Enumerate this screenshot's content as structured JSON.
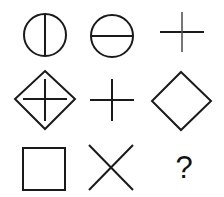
{
  "puzzle": {
    "type": "3x3 figure matrix",
    "rows": 3,
    "cols": 3,
    "cells": [
      {
        "row": 1,
        "col": 1,
        "shape": "circle-with-vertical-line"
      },
      {
        "row": 1,
        "col": 2,
        "shape": "circle-with-horizontal-line"
      },
      {
        "row": 1,
        "col": 3,
        "shape": "plus-cross"
      },
      {
        "row": 2,
        "col": 1,
        "shape": "diamond-with-plus"
      },
      {
        "row": 2,
        "col": 2,
        "shape": "plus-cross"
      },
      {
        "row": 2,
        "col": 3,
        "shape": "diamond"
      },
      {
        "row": 3,
        "col": 1,
        "shape": "square"
      },
      {
        "row": 3,
        "col": 2,
        "shape": "x-cross"
      },
      {
        "row": 3,
        "col": 3,
        "shape": "unknown",
        "label": "?"
      }
    ],
    "question_mark": "?",
    "colors": {
      "stroke": "#1a1a1a",
      "background": "#ffffff"
    }
  }
}
